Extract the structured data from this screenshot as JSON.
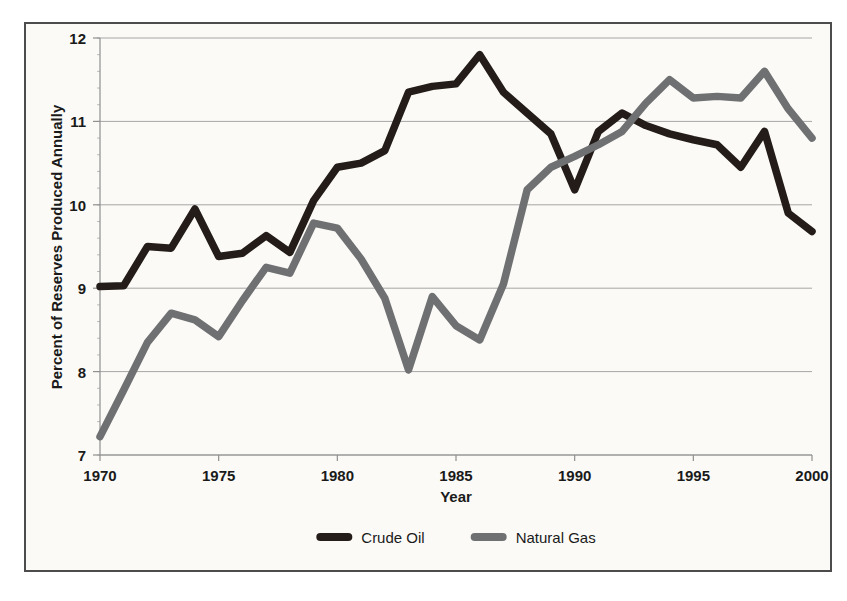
{
  "chart_data": {
    "type": "line",
    "title": "",
    "xlabel": "Year",
    "ylabel": "Percent of Reserves Produced Annually",
    "xlim": [
      1970,
      2000
    ],
    "ylim": [
      7,
      12
    ],
    "ytick_labels": [
      "12",
      "11",
      "10",
      "9",
      "8",
      "7"
    ],
    "yticks": [
      12,
      11,
      10,
      9,
      8,
      7
    ],
    "xtick_labels": [
      "1970",
      "1975",
      "1980",
      "1985",
      "1990",
      "1995",
      "2000"
    ],
    "xticks": [
      1970,
      1975,
      1980,
      1985,
      1990,
      1995,
      2000
    ],
    "grid": true,
    "legend_position": "bottom-center",
    "x": [
      1970,
      1971,
      1972,
      1973,
      1974,
      1975,
      1976,
      1977,
      1978,
      1979,
      1980,
      1981,
      1982,
      1983,
      1984,
      1985,
      1986,
      1987,
      1988,
      1989,
      1990,
      1991,
      1992,
      1993,
      1994,
      1995,
      1996,
      1997,
      1998,
      1999,
      2000
    ],
    "series": [
      {
        "name": "Crude Oil",
        "color": "#231c18",
        "values": [
          9.02,
          9.03,
          9.5,
          9.48,
          9.95,
          9.38,
          9.42,
          9.63,
          9.43,
          10.05,
          10.45,
          10.5,
          10.65,
          11.35,
          11.42,
          11.45,
          11.8,
          11.35,
          11.1,
          10.85,
          10.18,
          10.88,
          11.1,
          10.95,
          10.85,
          10.78,
          10.72,
          10.45,
          10.88,
          9.9,
          9.68
        ]
      },
      {
        "name": "Natural Gas",
        "color": "#6e7072",
        "values": [
          7.22,
          7.78,
          8.35,
          8.7,
          8.62,
          8.42,
          8.85,
          9.25,
          9.18,
          9.78,
          9.72,
          9.35,
          8.88,
          8.02,
          8.9,
          8.55,
          8.38,
          9.05,
          10.18,
          10.45,
          10.58,
          10.72,
          10.88,
          11.22,
          11.5,
          11.28,
          11.3,
          11.28,
          11.6,
          11.15,
          10.8
        ]
      }
    ]
  },
  "legend": {
    "items": [
      {
        "label": "Crude Oil",
        "color": "#231c18"
      },
      {
        "label": "Natural Gas",
        "color": "#6e7072"
      }
    ]
  },
  "axes": {
    "x_title": "Year",
    "y_title": "Percent of Reserves Produced Annually"
  }
}
